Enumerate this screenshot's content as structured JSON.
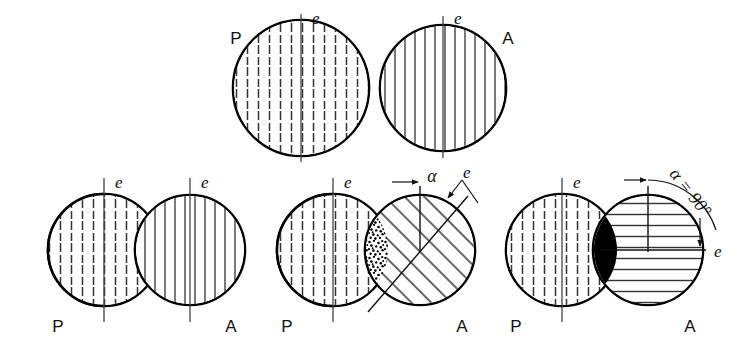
{
  "figure": {
    "background_color": "#ffffff",
    "ink_color": "#000000",
    "axis_color": "#444444"
  },
  "labels": {
    "polariser": "P",
    "analyser": "A",
    "axis": "e",
    "alpha": "α",
    "alpha_90": "α = 90°"
  },
  "top_row": {
    "items": [
      {
        "id": "top-p",
        "label": "P",
        "label_position": "upper-left",
        "axis_label": "e",
        "axis_orientation": "vertical",
        "fill_pattern": "dashed-vertical",
        "cx": 301,
        "cy": 88,
        "r": 68
      },
      {
        "id": "top-a",
        "label": "A",
        "label_position": "upper-right",
        "axis_label": "e",
        "axis_orientation": "vertical",
        "fill_pattern": "solid-vertical",
        "cx": 443,
        "cy": 88,
        "r": 63
      }
    ]
  },
  "bottom_row": {
    "groups": [
      {
        "id": "group-alpha-0",
        "alpha_label": "",
        "alpha_value_deg": 0,
        "overlap_fill": "none",
        "p_circle": {
          "label": "P",
          "axis_label": "e",
          "axis_orientation": "vertical",
          "fill_pattern": "dashed-vertical",
          "cx": 104,
          "cy": 250,
          "r": 56
        },
        "a_circle": {
          "label": "A",
          "axis_label": "e",
          "axis_orientation": "vertical",
          "fill_pattern": "solid-vertical",
          "cx": 190,
          "cy": 250,
          "r": 55
        }
      },
      {
        "id": "group-alpha-mid",
        "alpha_label": "α",
        "alpha_value_deg": 45,
        "overlap_fill": "stipple",
        "p_circle": {
          "label": "P",
          "axis_label": "e",
          "axis_orientation": "vertical",
          "fill_pattern": "dashed-vertical",
          "cx": 333,
          "cy": 250,
          "r": 56
        },
        "a_circle": {
          "label": "A",
          "axis_label": "e",
          "axis_orientation": "tilted-45",
          "fill_pattern": "solid-diagonal",
          "cx": 420,
          "cy": 250,
          "r": 55
        }
      },
      {
        "id": "group-alpha-90",
        "alpha_label": "α = 90°",
        "alpha_value_deg": 90,
        "overlap_fill": "black",
        "p_circle": {
          "label": "P",
          "axis_label": "e",
          "axis_orientation": "vertical",
          "fill_pattern": "dashed-vertical",
          "cx": 562,
          "cy": 250,
          "r": 56
        },
        "a_circle": {
          "label": "A",
          "axis_label": "e",
          "axis_orientation": "horizontal",
          "fill_pattern": "solid-horizontal",
          "cx": 648,
          "cy": 250,
          "r": 55
        }
      }
    ]
  }
}
